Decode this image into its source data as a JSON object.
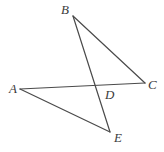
{
  "figure": {
    "kind": "geometry-diagram",
    "width": 164,
    "height": 152,
    "background_color": "#ffffff",
    "stroke_color": "#4a4a4a",
    "label_color": "#3b3b3b",
    "stroke_width": 1.2,
    "points": {
      "A": {
        "label": "A",
        "x": 20,
        "y": 89
      },
      "B": {
        "label": "B",
        "x": 73,
        "y": 16
      },
      "C": {
        "label": "C",
        "x": 145,
        "y": 83
      },
      "D": {
        "label": "D",
        "x": 95,
        "y": 87
      },
      "E": {
        "label": "E",
        "x": 110,
        "y": 132
      }
    },
    "segments": [
      {
        "name": "segment-BC",
        "from": "B",
        "to": "C",
        "d": "M 73 16 L 145 83"
      },
      {
        "name": "segment-BE",
        "from": "B",
        "to": "E",
        "d": "M 73 16 L 110 132"
      },
      {
        "name": "segment-AC",
        "from": "A",
        "to": "C",
        "d": "M 20 89 L 145 83"
      },
      {
        "name": "segment-AE",
        "from": "A",
        "to": "E",
        "d": "M 20 89 L 110 132"
      }
    ]
  }
}
